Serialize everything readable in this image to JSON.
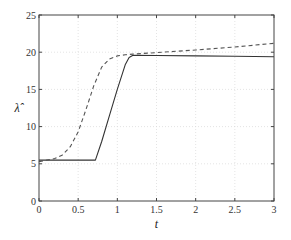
{
  "chart_data": {
    "type": "line",
    "title": "",
    "xlabel": "t",
    "ylabel": "λ̂",
    "xlim": [
      0,
      3
    ],
    "ylim": [
      0,
      25
    ],
    "xticks": [
      0,
      0.5,
      1,
      1.5,
      2,
      2.5,
      3
    ],
    "xtick_labels": [
      "0",
      "0.5",
      "1",
      "1.5",
      "2",
      "2.5",
      "3"
    ],
    "yticks": [
      0,
      5,
      10,
      15,
      20,
      25
    ],
    "ytick_labels": [
      "0",
      "5",
      "10",
      "15",
      "20",
      "25"
    ],
    "grid": true,
    "legend": null,
    "series": [
      {
        "name": "solid",
        "style": "solid",
        "color": "#333333",
        "x": [
          0,
          0.1,
          0.3,
          0.5,
          0.72,
          0.8,
          0.9,
          1.0,
          1.1,
          1.15,
          1.2,
          1.5,
          2.0,
          2.5,
          3.0
        ],
        "y": [
          5.5,
          5.5,
          5.5,
          5.5,
          5.5,
          8.0,
          11.5,
          15.0,
          18.3,
          19.3,
          19.6,
          19.55,
          19.5,
          19.45,
          19.4
        ]
      },
      {
        "name": "dashed",
        "style": "dashed",
        "color": "#555555",
        "x": [
          0,
          0.1,
          0.2,
          0.3,
          0.4,
          0.5,
          0.6,
          0.7,
          0.8,
          0.9,
          1.0,
          1.1,
          1.2,
          1.5,
          2.0,
          2.5,
          3.0
        ],
        "y": [
          5.3,
          5.5,
          5.7,
          6.2,
          7.3,
          9.3,
          12.3,
          15.5,
          18.0,
          19.1,
          19.5,
          19.65,
          19.75,
          19.95,
          20.3,
          20.7,
          21.2
        ]
      }
    ]
  }
}
